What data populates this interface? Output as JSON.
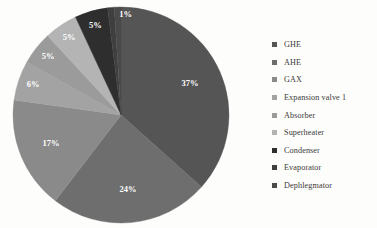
{
  "background_color": "#fdfdfb",
  "chart_data": {
    "type": "pie",
    "title": "",
    "labels": [
      "GHE",
      "AHE",
      "GAX",
      "Expansion valve 1",
      "Absorber",
      "Superheater",
      "Condenser",
      "Evaporator",
      "Dephlegmator"
    ],
    "values": [
      37,
      24,
      17,
      6,
      5,
      5,
      5,
      1,
      1
    ],
    "value_labels": [
      "37%",
      "24%",
      "17%",
      "6%",
      "5%",
      "5%",
      "5%",
      "1%",
      "1%"
    ],
    "colors": [
      "#555555",
      "#6e6e6e",
      "#8a8a8a",
      "#a3a3a3",
      "#9b9b9b",
      "#b4b4b4",
      "#2e2e2e",
      "#3f3f3f",
      "#4a4a4a"
    ],
    "unit": "%",
    "legend_position": "right",
    "grid": false,
    "start_angle_deg": 0,
    "direction": "clockwise",
    "label_color": "#ffffff"
  },
  "legend": {
    "items": [
      {
        "label": "GHE",
        "color": "#555555"
      },
      {
        "label": "AHE",
        "color": "#6e6e6e"
      },
      {
        "label": "GAX",
        "color": "#8a8a8a"
      },
      {
        "label": "Expansion valve 1",
        "color": "#a3a3a3"
      },
      {
        "label": "Absorber",
        "color": "#9b9b9b"
      },
      {
        "label": "Superheater",
        "color": "#b4b4b4"
      },
      {
        "label": "Condenser",
        "color": "#2e2e2e"
      },
      {
        "label": "Evaporator",
        "color": "#3f3f3f"
      },
      {
        "label": "Dephlegmator",
        "color": "#4a4a4a"
      }
    ]
  }
}
